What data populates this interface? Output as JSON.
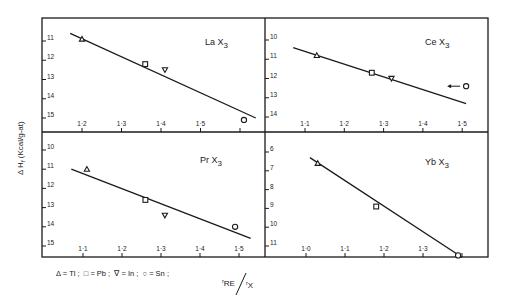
{
  "figure": {
    "ylabel": "Δ H",
    "ylabel_sub": "f",
    "ylabel_unit": " (Kcal/g-at)",
    "xlabel_num": "r",
    "xlabel_num_sub": "RE",
    "xlabel_den": "r",
    "xlabel_den_sub": "X",
    "legend": [
      {
        "marker": "triangle-up",
        "symbol": "Δ",
        "label": "= Tl ;"
      },
      {
        "marker": "square",
        "symbol": "□",
        "label": "= Pb ;"
      },
      {
        "marker": "triangle-down",
        "symbol": "∇",
        "label": "= In ;"
      },
      {
        "marker": "circle",
        "symbol": "○",
        "label": "= Sn ;"
      }
    ]
  },
  "chart_data": [
    {
      "type": "scatter",
      "title": "LaX3",
      "title_main": "La X",
      "title_sub": "3",
      "xlabel": "rRE/rX",
      "ylabel": "ΔHf (Kcal/g-at)",
      "y_inverted": true,
      "xlim": [
        1.16,
        1.63
      ],
      "ylim": [
        10.5,
        15.6
      ],
      "x_ticks": [
        1.2,
        1.3,
        1.4,
        1.5,
        1.6
      ],
      "x_tick_labels": [
        "1·2",
        "1·3",
        "1·4",
        "1·5",
        ""
      ],
      "y_ticks": [
        11,
        12,
        13,
        14,
        15
      ],
      "y_tick_labels": [
        "11",
        "12",
        "13",
        "14",
        "15"
      ],
      "points": [
        {
          "element": "Tl",
          "marker": "triangle-up",
          "x": 1.2,
          "y": 10.9
        },
        {
          "element": "Pb",
          "marker": "square",
          "x": 1.36,
          "y": 12.2
        },
        {
          "element": "In",
          "marker": "triangle-down",
          "x": 1.41,
          "y": 12.5
        },
        {
          "element": "Sn",
          "marker": "circle",
          "x": 1.61,
          "y": 15.1
        }
      ],
      "fit_line": {
        "x": [
          1.17,
          1.64
        ],
        "y": [
          10.6,
          15.0
        ]
      },
      "grid": false
    },
    {
      "type": "scatter",
      "title": "CeX3",
      "title_main": "Ce X",
      "title_sub": "3",
      "xlabel": "rRE/rX",
      "ylabel": "ΔHf (Kcal/g-at)",
      "y_inverted": true,
      "xlim": [
        1.0,
        1.57
      ],
      "ylim": [
        9.5,
        14.6
      ],
      "x_ticks": [
        1.1,
        1.2,
        1.3,
        1.4,
        1.5
      ],
      "x_tick_labels": [
        "1·1",
        "1·2",
        "1·3",
        "1·4",
        "1·5"
      ],
      "y_ticks": [
        10,
        11,
        12,
        13,
        14
      ],
      "y_tick_labels": [
        "10",
        "11",
        "12",
        "13",
        "14"
      ],
      "points": [
        {
          "element": "Tl",
          "marker": "triangle-up",
          "x": 1.13,
          "y": 10.8
        },
        {
          "element": "Pb",
          "marker": "square",
          "x": 1.27,
          "y": 11.7
        },
        {
          "element": "In",
          "marker": "triangle-down",
          "x": 1.32,
          "y": 12.0
        },
        {
          "element": "Sn",
          "marker": "circle",
          "x": 1.51,
          "y": 12.4,
          "annotation": "arrow pointing left"
        }
      ],
      "fit_line": {
        "x": [
          1.07,
          1.51
        ],
        "y": [
          10.4,
          13.3
        ]
      },
      "grid": false
    },
    {
      "type": "scatter",
      "title": "PrX3",
      "title_main": "Pr X",
      "title_sub": "3",
      "xlabel": "rRE/rX",
      "ylabel": "ΔHf (Kcal/g-at)",
      "y_inverted": true,
      "xlim": [
        1.0,
        1.57
      ],
      "ylim": [
        9.6,
        15.6
      ],
      "x_ticks": [
        1.1,
        1.2,
        1.3,
        1.4,
        1.5
      ],
      "x_tick_labels": [
        "1·1",
        "1·2",
        "1·3",
        "1·4",
        "1·5"
      ],
      "y_ticks": [
        10,
        11,
        12,
        13,
        14,
        15
      ],
      "y_tick_labels": [
        "10",
        "11",
        "12",
        "13",
        "14",
        "15"
      ],
      "points": [
        {
          "element": "Tl",
          "marker": "triangle-up",
          "x": 1.11,
          "y": 11.0
        },
        {
          "element": "Pb",
          "marker": "square",
          "x": 1.26,
          "y": 12.6
        },
        {
          "element": "In",
          "marker": "triangle-down",
          "x": 1.31,
          "y": 13.4
        },
        {
          "element": "Sn",
          "marker": "circle",
          "x": 1.49,
          "y": 14.0
        }
      ],
      "fit_line": {
        "x": [
          1.07,
          1.53
        ],
        "y": [
          11.0,
          14.6
        ]
      },
      "grid": false
    },
    {
      "type": "scatter",
      "title": "YbX3",
      "title_main": "Yb X",
      "title_sub": "3",
      "xlabel": "rRE/rX",
      "ylabel": "ΔHf (Kcal/g-at)",
      "y_inverted": true,
      "xlim": [
        0.9,
        1.47
      ],
      "ylim": [
        5.6,
        11.6
      ],
      "x_ticks": [
        1.0,
        1.1,
        1.2,
        1.3,
        1.4
      ],
      "x_tick_labels": [
        "1·0",
        "1·1",
        "1·2",
        "1·3",
        ""
      ],
      "y_ticks": [
        6,
        7,
        8,
        9,
        10,
        11
      ],
      "y_tick_labels": [
        "6",
        "7",
        "8",
        "9",
        "10",
        "11"
      ],
      "points": [
        {
          "element": "Tl",
          "marker": "triangle-up",
          "x": 1.03,
          "y": 6.6
        },
        {
          "element": "Pb",
          "marker": "square",
          "x": 1.18,
          "y": 8.9
        },
        {
          "element": "Sn",
          "marker": "circle",
          "x": 1.39,
          "y": 11.5
        }
      ],
      "fit_line": {
        "x": [
          1.01,
          1.4
        ],
        "y": [
          6.3,
          11.6
        ]
      },
      "grid": false
    }
  ]
}
